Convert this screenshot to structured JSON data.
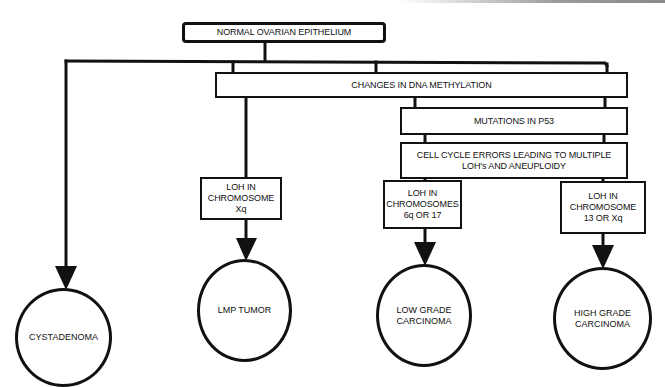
{
  "diagram": {
    "type": "flowchart",
    "title": "NORMAL OVARIAN EPITHELIUM",
    "process_steps": [
      {
        "id": "dna_methylation",
        "label": "CHANGES IN DNA METHYLATION"
      },
      {
        "id": "p53",
        "label": "MUTATIONS IN P53"
      },
      {
        "id": "cell_cycle",
        "label": "CELL CYCLE ERRORS LEADING TO MULTIPLE\nLOH's AND ANEUPLOIDY"
      }
    ],
    "loh_boxes": [
      {
        "id": "loh_xq",
        "label": "LOH IN\nCHROMOSOME\nXq"
      },
      {
        "id": "loh_6q17",
        "label": "LOH IN\nCHROMOSOMES\n6q OR 17"
      },
      {
        "id": "loh_13xq",
        "label": "LOH IN\nCHROMOSOME\n13 OR Xq"
      }
    ],
    "outcomes": [
      {
        "id": "cystadenoma",
        "label": "CYSTADENOMA"
      },
      {
        "id": "lmp_tumor",
        "label": "LMP TUMOR"
      },
      {
        "id": "low_grade",
        "label": "LOW GRADE\nCARCINOMA"
      },
      {
        "id": "high_grade",
        "label": "HIGH GRADE\nCARCINOMA"
      }
    ],
    "edges": [
      {
        "from": "NORMAL OVARIAN EPITHELIUM",
        "to": "CYSTADENOMA"
      },
      {
        "from": "NORMAL OVARIAN EPITHELIUM",
        "to": "CHANGES IN DNA METHYLATION"
      },
      {
        "from": "CHANGES IN DNA METHYLATION",
        "to": "LOH IN CHROMOSOME Xq"
      },
      {
        "from": "LOH IN CHROMOSOME Xq",
        "to": "LMP TUMOR"
      },
      {
        "from": "CHANGES IN DNA METHYLATION",
        "to": "MUTATIONS IN P53"
      },
      {
        "from": "MUTATIONS IN P53",
        "to": "CELL CYCLE ERRORS LEADING TO MULTIPLE LOH's AND ANEUPLOIDY"
      },
      {
        "from": "CELL CYCLE ERRORS LEADING TO MULTIPLE LOH's AND ANEUPLOIDY",
        "to": "LOH IN CHROMOSOMES 6q OR 17"
      },
      {
        "from": "CELL CYCLE ERRORS LEADING TO MULTIPLE LOH's AND ANEUPLOIDY",
        "to": "LOH IN CHROMOSOME 13 OR Xq"
      },
      {
        "from": "LOH IN CHROMOSOMES 6q OR 17",
        "to": "LOW GRADE CARCINOMA"
      },
      {
        "from": "LOH IN CHROMOSOME 13 OR Xq",
        "to": "HIGH GRADE CARCINOMA"
      }
    ],
    "colors": {
      "line": "#111111",
      "background": "#ffffff"
    }
  }
}
